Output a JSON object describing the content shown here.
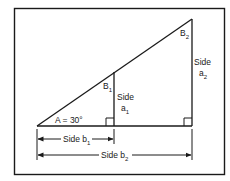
{
  "figure": {
    "border_color": "#1a1a1a",
    "line_color": "#1a1a1a",
    "background": "#ffffff"
  },
  "labels": {
    "angle_a": "A = 30°",
    "angle_b1_main": "B",
    "angle_b1_sub": "1",
    "angle_b2_main": "B",
    "angle_b2_sub": "2",
    "side_a1_word": "Side",
    "side_a1_main": "a",
    "side_a1_sub": "1",
    "side_a2_word": "Side",
    "side_a2_main": "a",
    "side_a2_sub": "2",
    "side_b1_main": "Side  b",
    "side_b1_sub": "1",
    "side_b2_main": "Side  b",
    "side_b2_sub": "2"
  },
  "geometry": {
    "angle_A_degrees": 30,
    "vertex_A": [
      37,
      126
    ],
    "inner_vertical_x": 114,
    "inner_vertical_top": [
      114,
      72
    ],
    "outer_vertical_x": 192,
    "apex": [
      192,
      19
    ]
  }
}
